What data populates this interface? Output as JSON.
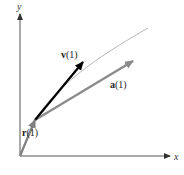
{
  "diagram": {
    "axes": {
      "x_label": "x",
      "y_label": "y",
      "origin": [
        20,
        156
      ],
      "x_end": [
        170,
        156
      ],
      "y_end": [
        20,
        14
      ]
    },
    "curve": {
      "label": "",
      "color": "#b8b8b8",
      "path": "M20,156 C27,140 31,130 35,120 C60,80 110,50 148,28"
    },
    "point": [
      35,
      120
    ],
    "vectors": [
      {
        "id": "r",
        "label_main": "r",
        "label_arg": "(1)",
        "from": [
          20,
          156
        ],
        "to": [
          35,
          120
        ],
        "color": "#808080",
        "label_pos": [
          22,
          136
        ]
      },
      {
        "id": "v",
        "label_main": "v",
        "label_arg": "(1)",
        "from": [
          35,
          120
        ],
        "to": [
          83,
          62
        ],
        "color": "#000000",
        "label_pos": [
          61,
          58
        ]
      },
      {
        "id": "a",
        "label_main": "a",
        "label_arg": "(1)",
        "from": [
          35,
          120
        ],
        "to": [
          133,
          61
        ],
        "color": "#8a8a8a",
        "label_pos": [
          110,
          88
        ]
      }
    ],
    "axis_color": "#555555"
  }
}
